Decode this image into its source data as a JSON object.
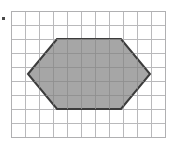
{
  "figure": {
    "caption": "",
    "marker_label": "",
    "background_color": "#ffffff"
  },
  "grid": {
    "columns": 11,
    "rows": 9,
    "cell_size_px": 14,
    "origin_x_px": 11,
    "origin_y_px": 11,
    "line_color": "#b9b9bb",
    "border_color": "#b0b0b2",
    "line_width_px": 1
  },
  "shape": {
    "name": "hexagon",
    "sides": 6,
    "fill_color": "#a6a6a6",
    "fill_opacity": 1,
    "stroke_color": "#3c3c3c",
    "stroke_width_px": 2,
    "vertices_grid_units": [
      [
        1.2,
        4.5
      ],
      [
        3.3,
        2.0
      ],
      [
        7.85,
        2.0
      ],
      [
        9.9,
        4.5
      ],
      [
        7.85,
        7.0
      ],
      [
        3.3,
        7.0
      ]
    ],
    "vertices_px": [
      [
        28,
        74
      ],
      [
        57,
        39
      ],
      [
        121,
        39
      ],
      [
        150,
        74
      ],
      [
        121,
        109
      ],
      [
        57,
        109
      ]
    ]
  },
  "marker": {
    "name": "corner-dot",
    "color": "#4a4a4a",
    "x_px": 2,
    "y_px": 17,
    "size_px": 3
  }
}
